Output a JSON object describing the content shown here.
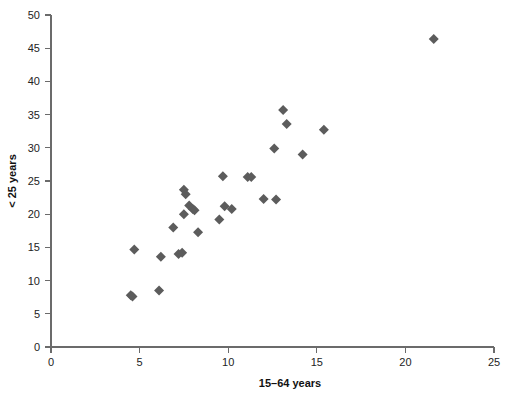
{
  "chart_data": {
    "type": "scatter",
    "title": "",
    "xlabel": "15–64 years",
    "ylabel": "< 25 years",
    "xlim": [
      0,
      25
    ],
    "ylim": [
      0,
      50
    ],
    "xticks": [
      0,
      5,
      10,
      15,
      20,
      25
    ],
    "yticks": [
      0,
      5,
      10,
      15,
      20,
      25,
      30,
      35,
      40,
      45,
      50
    ],
    "xtick_labels": [
      "0",
      "5",
      "10",
      "15",
      "20",
      "25"
    ],
    "ytick_labels": [
      "0",
      "5",
      "10",
      "15",
      "20",
      "25",
      "30",
      "35",
      "40",
      "45",
      "50"
    ],
    "grid": false,
    "legend": null,
    "marker_shape": "diamond",
    "marker_color": "#5c5c5c",
    "axis_color": "#6b6b6b",
    "points": [
      {
        "x": 4.5,
        "y": 7.8
      },
      {
        "x": 4.6,
        "y": 7.6
      },
      {
        "x": 4.7,
        "y": 14.7
      },
      {
        "x": 6.1,
        "y": 8.5
      },
      {
        "x": 6.2,
        "y": 13.6
      },
      {
        "x": 6.9,
        "y": 18.0
      },
      {
        "x": 7.2,
        "y": 14.0
      },
      {
        "x": 7.4,
        "y": 14.2
      },
      {
        "x": 7.5,
        "y": 23.7
      },
      {
        "x": 7.6,
        "y": 23.0
      },
      {
        "x": 7.5,
        "y": 20.0
      },
      {
        "x": 7.8,
        "y": 21.3
      },
      {
        "x": 8.0,
        "y": 20.8
      },
      {
        "x": 8.1,
        "y": 20.6
      },
      {
        "x": 8.3,
        "y": 17.3
      },
      {
        "x": 9.5,
        "y": 19.2
      },
      {
        "x": 9.7,
        "y": 25.7
      },
      {
        "x": 9.8,
        "y": 21.2
      },
      {
        "x": 10.2,
        "y": 20.8
      },
      {
        "x": 11.1,
        "y": 25.6
      },
      {
        "x": 11.3,
        "y": 25.6
      },
      {
        "x": 12.0,
        "y": 22.3
      },
      {
        "x": 12.7,
        "y": 22.2
      },
      {
        "x": 12.6,
        "y": 29.9
      },
      {
        "x": 13.1,
        "y": 35.7
      },
      {
        "x": 13.3,
        "y": 33.6
      },
      {
        "x": 14.2,
        "y": 29.0
      },
      {
        "x": 15.4,
        "y": 32.7
      },
      {
        "x": 21.6,
        "y": 46.4
      }
    ]
  }
}
